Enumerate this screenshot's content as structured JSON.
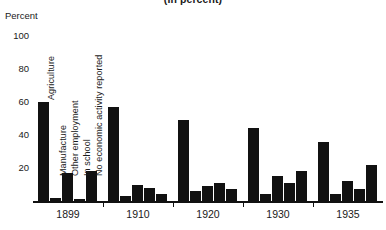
{
  "chart_data": {
    "type": "bar",
    "title": "(In percent)",
    "xlabel": "",
    "ylabel": "Percent",
    "ylim": [
      0,
      100
    ],
    "yticks": [
      20,
      40,
      60,
      80,
      100
    ],
    "grid": false,
    "legend_position": "inline-vertical-labels-on-first-group",
    "categories": [
      "1899",
      "1910",
      "1920",
      "1930",
      "1935"
    ],
    "series": [
      {
        "name": "Agriculture",
        "values": [
          60,
          57,
          49,
          44,
          36
        ]
      },
      {
        "name": "Manufacture",
        "values": [
          2,
          3,
          6,
          4,
          4
        ]
      },
      {
        "name": "Other employment",
        "values": [
          17,
          10,
          9,
          15,
          12
        ]
      },
      {
        "name": "In school",
        "values": [
          1,
          8,
          11,
          11,
          7
        ]
      },
      {
        "name": "No economic activity reported",
        "values": [
          18,
          4,
          7,
          18,
          22
        ]
      }
    ]
  },
  "axis": {
    "y_title": "Percent",
    "y_ticks": [
      "100",
      "80",
      "60",
      "40",
      "20"
    ],
    "x_ticks": [
      "1899",
      "1910",
      "1920",
      "1930",
      "1935"
    ]
  },
  "series_labels": [
    "Agriculture",
    "Manufacture",
    "Other employment",
    "In school",
    "No economic activity reported"
  ],
  "header": {
    "title": "(In percent)"
  }
}
